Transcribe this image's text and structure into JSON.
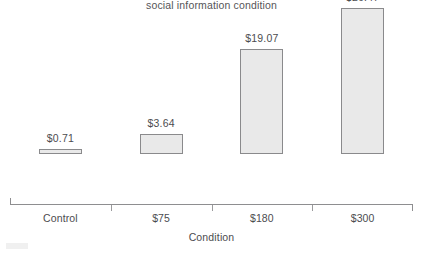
{
  "chart_data": {
    "type": "bar",
    "title": "social information condition",
    "xlabel": "Condition",
    "ylabel": "",
    "categories": [
      "Control",
      "$75",
      "$180",
      "$300"
    ],
    "values": [
      0.71,
      3.64,
      19.07,
      26.47
    ],
    "value_labels": [
      "$0.71",
      "$3.64",
      "$19.07",
      "$26.47"
    ],
    "ylim": [
      0,
      29
    ],
    "grid": false,
    "legend": null,
    "axis": {
      "baseline_visible": true,
      "ticks_visible": true,
      "y_axis_visible": false
    },
    "style": {
      "bar_fill": "#e9e9e9",
      "bar_border": "#8a8a8c",
      "axis_color": "#8e8e90",
      "text_color": "#4c4c4f",
      "title_color": "#555558",
      "background": "#ffffff"
    }
  },
  "title_clipped_fragment": "g"
}
